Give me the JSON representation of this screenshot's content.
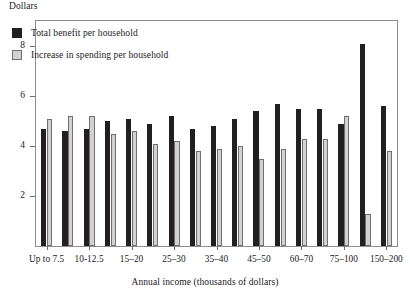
{
  "chart_data": {
    "type": "bar",
    "title": "",
    "ylabel": "Dollars",
    "xlabel": "Annual income (thousands of dollars)",
    "ylim": [
      0,
      9
    ],
    "yticks": [
      2,
      4,
      6,
      8
    ],
    "ytick_labels": [
      "2",
      "4",
      "6",
      "8"
    ],
    "grid": false,
    "legend_position": "upper-left-inside",
    "categories": [
      "Up to 7.5",
      "7.5-10",
      "10-12.5",
      "12.5-15",
      "15-20",
      "20-25",
      "25-30",
      "30-35",
      "35-40",
      "40-45",
      "45-50",
      "50-60",
      "60-70",
      "70-75",
      "75-100",
      "100-150",
      "150-200"
    ],
    "xtick_labels": [
      "Up to 7.5",
      "10-12.5",
      "15–20",
      "25–30",
      "35–40",
      "45–50",
      "60–70",
      "75–100",
      "150–200"
    ],
    "xtick_label_categories": [
      0,
      2,
      4,
      6,
      8,
      10,
      12,
      14,
      16
    ],
    "series": [
      {
        "name": "Total benefit per household",
        "color": "#231f20",
        "values": [
          4.7,
          4.6,
          4.7,
          5.0,
          5.1,
          4.9,
          5.2,
          4.7,
          4.8,
          5.1,
          5.4,
          5.7,
          5.5,
          5.5,
          4.9,
          8.1,
          5.6
        ]
      },
      {
        "name": "Increase in spending per household",
        "color": "#d2d2d2",
        "values": [
          5.1,
          5.2,
          5.2,
          4.5,
          4.6,
          4.1,
          4.2,
          3.8,
          3.9,
          4.0,
          3.5,
          3.9,
          4.3,
          4.3,
          5.2,
          1.3,
          3.8
        ]
      }
    ]
  },
  "legend": {
    "items": [
      {
        "label": "Total benefit per household",
        "swatch": "dark"
      },
      {
        "label": "Increase in spending per household",
        "swatch": "light"
      }
    ]
  }
}
